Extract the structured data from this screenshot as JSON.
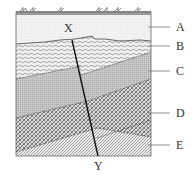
{
  "diagram": {
    "type": "geological-cross-section",
    "fault": {
      "top_label": "X",
      "bottom_label": "Y"
    },
    "layers": [
      {
        "id": "A",
        "label": "A",
        "pattern": "fine-dots",
        "position": "top"
      },
      {
        "id": "B",
        "label": "B",
        "pattern": "wavy-lines",
        "position": "second"
      },
      {
        "id": "C",
        "label": "C",
        "pattern": "gray-stipple",
        "position": "third"
      },
      {
        "id": "D",
        "label": "D",
        "pattern": "cross-hatch",
        "position": "fourth"
      },
      {
        "id": "E",
        "label": "E",
        "pattern": "diagonal-lines",
        "position": "bottom"
      }
    ],
    "surface": "grass/vegetation strip",
    "colors": {
      "line": "#222222",
      "stipple": "#b8b8b8",
      "surface": "#9a9a9a"
    }
  }
}
